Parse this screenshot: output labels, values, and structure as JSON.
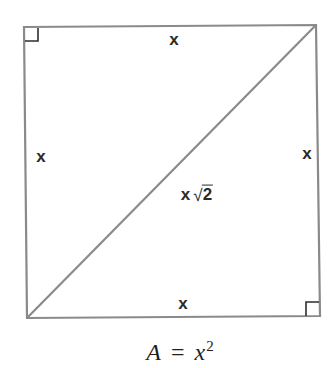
{
  "diagram": {
    "type": "geometry-square-with-diagonal",
    "colors": {
      "line": "#8a8a8a",
      "marker": "#2e2e2e",
      "text": "#2a2a2a",
      "background": "#ffffff"
    },
    "square": {
      "corners": {
        "top_left": [
          24,
          27
        ],
        "top_right": [
          316,
          25
        ],
        "bottom_right": [
          320,
          316
        ],
        "bottom_left": [
          27,
          318
        ]
      },
      "diagonal": {
        "from": "bottom_left",
        "to": "top_right"
      },
      "right_angle_markers": [
        "top_left",
        "bottom_right"
      ]
    },
    "labels": {
      "top_side": "x",
      "left_side": "x",
      "right_side": "x",
      "bottom_side": "x",
      "diagonal_var": "x",
      "diagonal_radical": "√",
      "diagonal_radicand": "2"
    },
    "formula": {
      "lhs": "A",
      "equals": "=",
      "rhs_base": "x",
      "rhs_exponent": "2"
    }
  }
}
